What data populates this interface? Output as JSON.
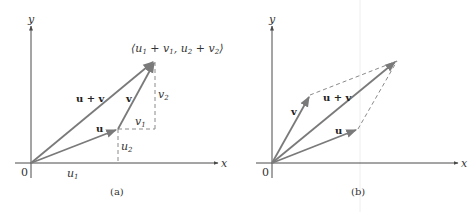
{
  "panels": [
    {
      "id": "a",
      "caption": "(a)",
      "origin_label": "0",
      "x_axis_label": "x",
      "y_axis_label": "y",
      "vectors": [
        {
          "name": "u",
          "label": "u",
          "from": [
            31,
            163
          ],
          "to": [
            118,
            129
          ]
        },
        {
          "name": "v",
          "label": "v",
          "from": [
            118,
            129
          ],
          "to": [
            155,
            61
          ]
        },
        {
          "name": "u+v",
          "label": "u + v",
          "from": [
            31,
            163
          ],
          "to": [
            155,
            61
          ]
        }
      ],
      "component_labels": {
        "u1": "u",
        "u1_sub": "1",
        "u2": "u",
        "u2_sub": "2",
        "v1": "v",
        "v1_sub": "1",
        "v2": "v",
        "v2_sub": "2"
      },
      "point_label": {
        "open": "⟨",
        "a": "u",
        "a_sub": "1",
        "plus1": " + ",
        "b": "v",
        "b_sub": "1",
        "comma": ", ",
        "c": "u",
        "c_sub": "2",
        "plus2": " + ",
        "d": "v",
        "d_sub": "2",
        "close": "⟩"
      }
    },
    {
      "id": "b",
      "caption": "(b)",
      "origin_label": "0",
      "x_axis_label": "x",
      "y_axis_label": "y",
      "vectors": [
        {
          "name": "u",
          "label": "u",
          "from": [
            272,
            163
          ],
          "to": [
            358,
            129
          ]
        },
        {
          "name": "v",
          "label": "v",
          "from": [
            272,
            163
          ],
          "to": [
            310,
            95
          ]
        },
        {
          "name": "u+v",
          "label": "u + v",
          "from": [
            272,
            163
          ],
          "to": [
            397,
            61
          ]
        }
      ]
    }
  ],
  "colors": {
    "vector": "#7a7a7a",
    "axis": "#4a4a4a",
    "dashed": "#8a8a8a",
    "text": "#333333"
  }
}
